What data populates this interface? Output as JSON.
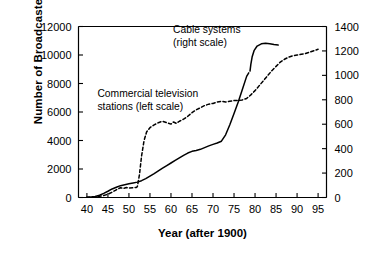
{
  "chart_data": {
    "type": "line",
    "title": "",
    "xlabel": "Year (after 1900)",
    "ylabel_left": "Number of Broadcasters",
    "ylabel_right": "",
    "xlim": [
      38,
      97
    ],
    "ylim_left": [
      0,
      12000
    ],
    "ylim_right": [
      0,
      1400
    ],
    "grid": false,
    "legend_position": "inline-annotations",
    "x_ticks": [
      "40",
      "45",
      "50",
      "55",
      "60",
      "65",
      "70",
      "75",
      "80",
      "85",
      "90",
      "95"
    ],
    "x_tick_values": [
      40,
      45,
      50,
      55,
      60,
      65,
      70,
      75,
      80,
      85,
      90,
      95
    ],
    "y_ticks_left": [
      "0",
      "2000",
      "4000",
      "6000",
      "8000",
      "10000",
      "12000"
    ],
    "y_tick_values_left": [
      0,
      2000,
      4000,
      6000,
      8000,
      10000,
      12000
    ],
    "y_ticks_right": [
      "0",
      "200",
      "400",
      "600",
      "800",
      "1000",
      "1200",
      "1400"
    ],
    "y_tick_values_right": [
      0,
      200,
      400,
      600,
      800,
      1000,
      1200,
      1400
    ],
    "annotations": [
      {
        "name": "cable-systems-annotation",
        "line1": "Cable systems",
        "line2": "(right scale)",
        "x": 60.5,
        "y_left": 11550
      },
      {
        "name": "commercial-tv-annotation",
        "line1": "Commercial television",
        "line2": "stations (left scale)",
        "x": 42.5,
        "y_left": 7050
      }
    ],
    "series": [
      {
        "name": "Commercial television stations (left scale)",
        "style": "dashed",
        "axis": "left",
        "color": "#000000",
        "points": [
          [
            40,
            20
          ],
          [
            41,
            40
          ],
          [
            42,
            60
          ],
          [
            43,
            90
          ],
          [
            44,
            140
          ],
          [
            45,
            230
          ],
          [
            46,
            370
          ],
          [
            47,
            540
          ],
          [
            48,
            690
          ],
          [
            48.7,
            640
          ],
          [
            49.4,
            700
          ],
          [
            50,
            660
          ],
          [
            51,
            690
          ],
          [
            51.7,
            700
          ],
          [
            52,
            760
          ],
          [
            52.5,
            1600
          ],
          [
            53,
            2900
          ],
          [
            53.6,
            4000
          ],
          [
            54.2,
            4600
          ],
          [
            55,
            4900
          ],
          [
            56,
            5100
          ],
          [
            57,
            5250
          ],
          [
            58,
            5350
          ],
          [
            59,
            5250
          ],
          [
            60,
            5150
          ],
          [
            60.6,
            5300
          ],
          [
            61.3,
            5200
          ],
          [
            62,
            5350
          ],
          [
            63,
            5500
          ],
          [
            64,
            5700
          ],
          [
            65,
            5950
          ],
          [
            66,
            6150
          ],
          [
            67,
            6300
          ],
          [
            68,
            6450
          ],
          [
            69,
            6550
          ],
          [
            70,
            6600
          ],
          [
            71,
            6700
          ],
          [
            72,
            6750
          ],
          [
            73,
            6700
          ],
          [
            74,
            6750
          ],
          [
            75,
            6800
          ],
          [
            76,
            6800
          ],
          [
            77,
            6850
          ],
          [
            78,
            6950
          ],
          [
            79,
            7200
          ],
          [
            80,
            7500
          ],
          [
            81,
            7850
          ],
          [
            82,
            8200
          ],
          [
            83,
            8550
          ],
          [
            84,
            8900
          ],
          [
            85,
            9200
          ],
          [
            86,
            9500
          ],
          [
            87,
            9700
          ],
          [
            88,
            9850
          ],
          [
            89,
            9950
          ],
          [
            90,
            10000
          ],
          [
            91,
            10050
          ],
          [
            92,
            10100
          ],
          [
            93,
            10200
          ],
          [
            94,
            10300
          ],
          [
            95,
            10400
          ]
        ]
      },
      {
        "name": "Broadcast stations (left scale, solid)",
        "style": "solid",
        "axis": "left",
        "color": "#000000",
        "points": [
          [
            40,
            10
          ],
          [
            41,
            30
          ],
          [
            42,
            70
          ],
          [
            43,
            160
          ],
          [
            44,
            290
          ],
          [
            45,
            440
          ],
          [
            46,
            600
          ],
          [
            47,
            720
          ],
          [
            48,
            830
          ],
          [
            49,
            900
          ],
          [
            50,
            960
          ],
          [
            51,
            1020
          ],
          [
            52,
            1080
          ],
          [
            53,
            1180
          ],
          [
            54,
            1320
          ],
          [
            55,
            1500
          ],
          [
            56,
            1680
          ],
          [
            57,
            1870
          ],
          [
            58,
            2060
          ],
          [
            59,
            2240
          ],
          [
            60,
            2420
          ],
          [
            61,
            2600
          ],
          [
            62,
            2780
          ],
          [
            63,
            2960
          ],
          [
            64,
            3120
          ],
          [
            65,
            3240
          ],
          [
            66,
            3300
          ],
          [
            67,
            3380
          ],
          [
            68,
            3500
          ],
          [
            69,
            3620
          ],
          [
            70,
            3730
          ],
          [
            71,
            3820
          ],
          [
            72,
            3950
          ],
          [
            73,
            4400
          ],
          [
            74,
            5100
          ],
          [
            75,
            5900
          ],
          [
            76,
            6700
          ],
          [
            77,
            7600
          ],
          [
            78,
            8500
          ],
          [
            78.5,
            8750
          ]
        ]
      },
      {
        "name": "Cable systems (right scale)",
        "style": "solid",
        "axis": "right",
        "color": "#000000",
        "points": [
          [
            78.8,
            1035
          ],
          [
            79.0,
            1090
          ],
          [
            79.3,
            1150
          ],
          [
            79.8,
            1205
          ],
          [
            80.5,
            1240
          ],
          [
            81.5,
            1258
          ],
          [
            82.5,
            1262
          ],
          [
            83.5,
            1258
          ],
          [
            84.5,
            1252
          ],
          [
            85.5,
            1248
          ]
        ]
      }
    ]
  }
}
